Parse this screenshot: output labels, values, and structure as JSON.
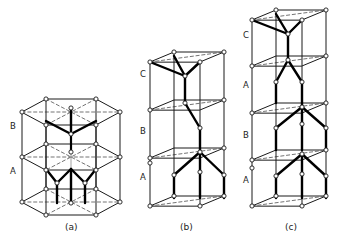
{
  "figure": {
    "type": "crystal-structure-diagram",
    "background_color": "#ffffff",
    "line_color": "#1a1a1a",
    "bond_color": "#000000",
    "dashed_color": "#444444",
    "atom_fill": "#ffffff"
  },
  "panels": [
    {
      "id": "a",
      "caption": "(a)",
      "caption_x": 65,
      "caption_y": 222,
      "cell_shape": "hexagonal-prism",
      "layer_labels": [
        {
          "text": "B",
          "x": 10,
          "y": 127
        },
        {
          "text": "A",
          "x": 10,
          "y": 172
        }
      ],
      "stacking": "AB"
    },
    {
      "id": "b",
      "caption": "(b)",
      "caption_x": 180,
      "caption_y": 222,
      "cell_shape": "rhombic-prism",
      "layer_labels": [
        {
          "text": "C",
          "x": 140,
          "y": 75
        },
        {
          "text": "B",
          "x": 140,
          "y": 132
        },
        {
          "text": "A",
          "x": 140,
          "y": 178
        }
      ],
      "stacking": "ABC"
    },
    {
      "id": "c",
      "caption": "(c)",
      "caption_x": 285,
      "caption_y": 222,
      "cell_shape": "rhombic-prism-tall",
      "layer_labels": [
        {
          "text": "C",
          "x": 243,
          "y": 36
        },
        {
          "text": "A",
          "x": 243,
          "y": 86
        },
        {
          "text": "B",
          "x": 243,
          "y": 136
        },
        {
          "text": "A",
          "x": 243,
          "y": 181
        }
      ],
      "stacking": "ABAC"
    }
  ]
}
